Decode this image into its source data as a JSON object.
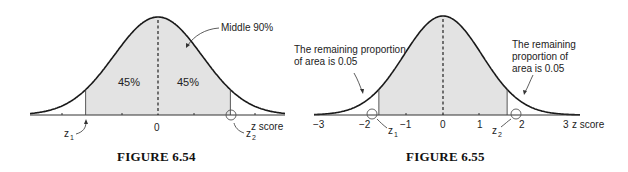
{
  "chart_data": [
    {
      "type": "area",
      "title": "FIGURE 6.54",
      "xlabel": "z score",
      "ylabel": "",
      "distribution": "standard normal",
      "tick_labels": [
        "0"
      ],
      "regions": [
        {
          "label": "45%",
          "from": "z1",
          "to": "0",
          "shaded": true
        },
        {
          "label": "45%",
          "from": "0",
          "to": "z2",
          "shaded": true
        }
      ],
      "annotations": [
        "Middle 90%",
        "z1",
        "z2"
      ],
      "markers": {
        "z1": -1.645,
        "z2": 1.645
      },
      "center_line": "dashed at 0",
      "grid": false
    },
    {
      "type": "area",
      "title": "FIGURE 6.55",
      "xlabel": "z score",
      "ylabel": "",
      "distribution": "standard normal",
      "tick_labels": [
        "-3",
        "-2",
        "-1",
        "0",
        "1",
        "2",
        "3"
      ],
      "xlim": [
        -3,
        3
      ],
      "regions": [
        {
          "label": "shaded middle",
          "from": "z1",
          "to": "z2",
          "shaded": true
        },
        {
          "label": "The remaining proportion of area is 0.05",
          "from": "-inf",
          "to": "z1",
          "shaded": false
        },
        {
          "label": "The remaining proportion of area is 0.05",
          "from": "z2",
          "to": "inf",
          "shaded": false
        }
      ],
      "annotations": [
        "The remaining proportion of area is 0.05",
        "The remaining proportion of area is 0.05",
        "z1",
        "z2"
      ],
      "markers": {
        "z1": -1.645,
        "z2": 1.645
      },
      "center_line": "dashed at 0",
      "grid": false
    }
  ],
  "fig1": {
    "caption": "FIGURE 6.54",
    "annotation": "Middle 90%",
    "left_pct": "45%",
    "right_pct": "45%",
    "zero_label": "0",
    "axis_label": "z score",
    "z1": "z",
    "z1_sub": "1",
    "z2": "z",
    "z2_sub": "2"
  },
  "fig2": {
    "caption": "FIGURE 6.55",
    "left_note_line1": "The remaining proportion",
    "left_note_line2": "of area is 0.05",
    "right_note_line1": "The remaining",
    "right_note_line2": "proportion of",
    "right_note_line3": "area is 0.05",
    "ticks": [
      "−3",
      "−2",
      "−1",
      "0",
      "1",
      "2",
      "3"
    ],
    "axis_label": "z score",
    "z1": "z",
    "z1_sub": "1",
    "z2": "z",
    "z2_sub": "2"
  },
  "colors": {
    "shade": "#e3e3e3",
    "line": "#1a1a1a",
    "marker": "#555555"
  }
}
